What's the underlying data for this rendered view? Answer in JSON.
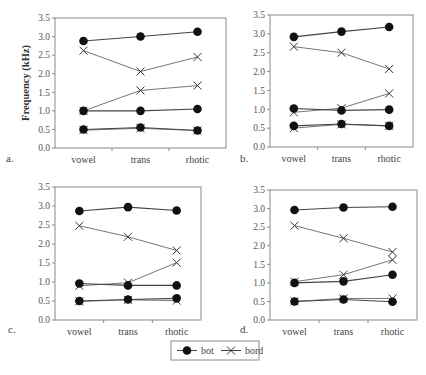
{
  "chart_data": [
    {
      "panel": "a.",
      "type": "line",
      "ylabel": "Frequency (kHz)",
      "ylim": [
        0,
        3.5
      ],
      "yticks": [
        "0.0",
        "0.5",
        "1.0",
        "1.5",
        "2.0",
        "2.5",
        "3.0",
        "3.5"
      ],
      "categories": [
        "vowel",
        "trans",
        "rhotic"
      ],
      "series": [
        {
          "name": "bot",
          "formant": "F1",
          "values": [
            0.5,
            0.55,
            0.47
          ]
        },
        {
          "name": "bot",
          "formant": "F2",
          "values": [
            1.0,
            1.0,
            1.05
          ]
        },
        {
          "name": "bot",
          "formant": "F3",
          "values": [
            2.88,
            3.0,
            3.13
          ]
        },
        {
          "name": "bord",
          "formant": "F1",
          "values": [
            0.48,
            0.53,
            0.47
          ]
        },
        {
          "name": "bord",
          "formant": "F2",
          "values": [
            1.0,
            1.55,
            1.68
          ]
        },
        {
          "name": "bord",
          "formant": "F3",
          "values": [
            2.62,
            2.06,
            2.45
          ]
        }
      ]
    },
    {
      "panel": "b.",
      "type": "line",
      "ylabel": "",
      "ylim": [
        0,
        3.5
      ],
      "yticks": [
        "0.0",
        "0.5",
        "1.0",
        "1.5",
        "2.0",
        "2.5",
        "3.0",
        "3.5"
      ],
      "categories": [
        "vowel",
        "trans",
        "rhotic"
      ],
      "series": [
        {
          "name": "bot",
          "formant": "F1",
          "values": [
            0.56,
            0.61,
            0.56
          ]
        },
        {
          "name": "bot",
          "formant": "F2",
          "values": [
            1.02,
            0.97,
            0.99
          ]
        },
        {
          "name": "bot",
          "formant": "F3",
          "values": [
            2.92,
            3.06,
            3.18
          ]
        },
        {
          "name": "bord",
          "formant": "F1",
          "values": [
            0.5,
            0.6,
            0.56
          ]
        },
        {
          "name": "bord",
          "formant": "F2",
          "values": [
            0.92,
            1.03,
            1.42
          ]
        },
        {
          "name": "bord",
          "formant": "F3",
          "values": [
            2.66,
            2.5,
            2.07
          ]
        }
      ]
    },
    {
      "panel": "c.",
      "type": "line",
      "ylabel": "",
      "ylim": [
        0,
        3.5
      ],
      "yticks": [
        "0.0",
        "0.5",
        "1.0",
        "1.5",
        "2.0",
        "2.5",
        "3.0",
        "3.5"
      ],
      "categories": [
        "vowel",
        "trans",
        "rhotic"
      ],
      "series": [
        {
          "name": "bot",
          "formant": "F1",
          "values": [
            0.5,
            0.54,
            0.57
          ]
        },
        {
          "name": "bot",
          "formant": "F2",
          "values": [
            0.96,
            0.91,
            0.91
          ]
        },
        {
          "name": "bot",
          "formant": "F3",
          "values": [
            2.87,
            2.97,
            2.88
          ]
        },
        {
          "name": "bord",
          "formant": "F1",
          "values": [
            0.49,
            0.53,
            0.51
          ]
        },
        {
          "name": "bord",
          "formant": "F2",
          "values": [
            0.9,
            0.98,
            1.51
          ]
        },
        {
          "name": "bord",
          "formant": "F3",
          "values": [
            2.48,
            2.19,
            1.83
          ]
        }
      ]
    },
    {
      "panel": "d.",
      "type": "line",
      "ylabel": "",
      "ylim": [
        0,
        3.5
      ],
      "yticks": [
        "0.0",
        "0.5",
        "1.0",
        "1.5",
        "2.0",
        "2.5",
        "3.0",
        "3.5"
      ],
      "categories": [
        "vowel",
        "trans",
        "rhotic"
      ],
      "series": [
        {
          "name": "bot",
          "formant": "F1",
          "values": [
            0.5,
            0.55,
            0.49
          ]
        },
        {
          "name": "bot",
          "formant": "F2",
          "values": [
            1.0,
            1.04,
            1.22
          ]
        },
        {
          "name": "bot",
          "formant": "F3",
          "values": [
            2.96,
            3.03,
            3.05
          ]
        },
        {
          "name": "bord",
          "formant": "F1",
          "values": [
            0.5,
            0.58,
            0.58
          ]
        },
        {
          "name": "bord",
          "formant": "F2",
          "values": [
            1.03,
            1.22,
            1.62
          ]
        },
        {
          "name": "bord",
          "formant": "F3",
          "values": [
            2.54,
            2.2,
            1.83
          ]
        }
      ]
    }
  ],
  "legend": {
    "position": "bottom-center",
    "entries": [
      {
        "label": "bot",
        "marker": "filled-circle"
      },
      {
        "label": "bord",
        "marker": "x-cross"
      }
    ]
  },
  "layout": {
    "panels": [
      {
        "x0": 55,
        "x1": 226,
        "y0": 18,
        "y1": 148,
        "letter_x": 6,
        "letter_y": 162
      },
      {
        "x0": 270,
        "x1": 413,
        "y0": 15,
        "y1": 147,
        "letter_x": 240,
        "letter_y": 162
      },
      {
        "x0": 55,
        "x1": 201,
        "y0": 187,
        "y1": 320,
        "letter_x": 8,
        "letter_y": 333
      },
      {
        "x0": 270,
        "x1": 417,
        "y0": 190,
        "y1": 320,
        "letter_x": 240,
        "letter_y": 333
      }
    ],
    "legend_box": {
      "x": 171,
      "y": 341,
      "w": 88,
      "h": 19
    }
  },
  "colors": {
    "axis": "#8a8a8a",
    "line": "#555555",
    "marker": "#111111",
    "text": "#444444"
  }
}
